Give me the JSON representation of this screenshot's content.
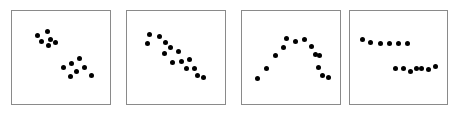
{
  "figure": {
    "background_color": "#ffffff",
    "panel_border_color": "#8a8a8a",
    "point_color": "#000000",
    "panel_count": 4
  },
  "chart_data": [
    {
      "type": "scatter",
      "title": "",
      "subtitle": "",
      "xlabel": "",
      "ylabel": "",
      "xlim": [
        0,
        100
      ],
      "ylim": [
        0,
        100
      ],
      "grid": false,
      "legend": "none",
      "annotation": "two separated clusters",
      "series": [
        {
          "name": "cluster-upper-left",
          "points": [
            [
              22,
              78
            ],
            [
              34,
              83
            ],
            [
              27,
              70
            ],
            [
              38,
              73
            ],
            [
              35,
              65
            ],
            [
              44,
              69
            ]
          ]
        },
        {
          "name": "cluster-lower-right",
          "points": [
            [
              53,
              38
            ],
            [
              63,
              42
            ],
            [
              72,
              49
            ],
            [
              68,
              33
            ],
            [
              78,
              38
            ],
            [
              61,
              26
            ],
            [
              86,
              28
            ]
          ]
        }
      ]
    },
    {
      "type": "scatter",
      "title": "",
      "subtitle": "",
      "xlabel": "",
      "ylabel": "",
      "xlim": [
        0,
        100
      ],
      "ylim": [
        0,
        100
      ],
      "grid": false,
      "legend": "none",
      "annotation": "strong negative linear relationship",
      "series": [
        {
          "name": "negative-trend",
          "points": [
            [
              19,
              79
            ],
            [
              16,
              68
            ],
            [
              30,
              76
            ],
            [
              38,
              69
            ],
            [
              44,
              62
            ],
            [
              36,
              55
            ],
            [
              53,
              57
            ],
            [
              46,
              44
            ],
            [
              57,
              45
            ],
            [
              66,
              47
            ],
            [
              63,
              36
            ],
            [
              72,
              36
            ],
            [
              75,
              27
            ],
            [
              83,
              25
            ]
          ]
        }
      ]
    },
    {
      "type": "scatter",
      "title": "",
      "subtitle": "",
      "xlabel": "",
      "ylabel": "",
      "xlim": [
        0,
        100
      ],
      "ylim": [
        0,
        100
      ],
      "grid": false,
      "legend": "none",
      "annotation": "inverted-U quadratic relationship",
      "series": [
        {
          "name": "quadratic-arch",
          "points": [
            [
              10,
              24
            ],
            [
              21,
              36
            ],
            [
              32,
              52
            ],
            [
              41,
              62
            ],
            [
              45,
              74
            ],
            [
              55,
              70
            ],
            [
              66,
              72
            ],
            [
              74,
              64
            ],
            [
              79,
              54
            ],
            [
              84,
              52
            ],
            [
              83,
              38
            ],
            [
              87,
              27
            ],
            [
              95,
              25
            ]
          ]
        }
      ]
    },
    {
      "type": "scatter",
      "title": "",
      "subtitle": "",
      "xlabel": "",
      "ylabel": "",
      "xlim": [
        0,
        100
      ],
      "ylim": [
        0,
        100
      ],
      "grid": false,
      "legend": "none",
      "annotation": "step discontinuity between two flat segments",
      "series": [
        {
          "name": "upper-segment",
          "points": [
            [
              7,
              73
            ],
            [
              17,
              69
            ],
            [
              28,
              67
            ],
            [
              39,
              67
            ],
            [
              50,
              67
            ],
            [
              61,
              67
            ]
          ]
        },
        {
          "name": "lower-segment",
          "points": [
            [
              46,
              36
            ],
            [
              56,
              36
            ],
            [
              64,
              32
            ],
            [
              71,
              36
            ],
            [
              78,
              36
            ],
            [
              86,
              35
            ],
            [
              94,
              39
            ]
          ]
        }
      ]
    }
  ]
}
